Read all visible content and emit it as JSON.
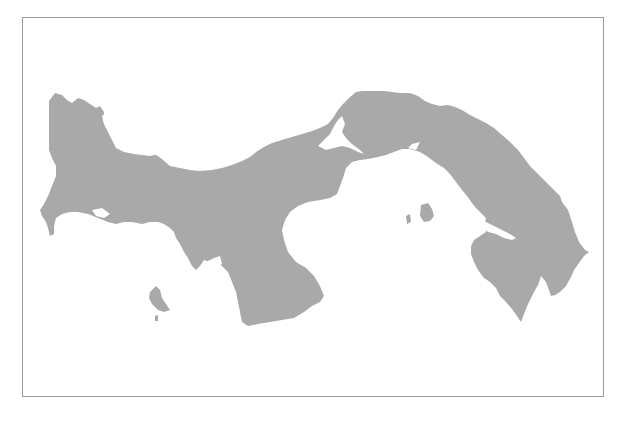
{
  "map": {
    "country": "Panama",
    "land_color": "#a9a9a9",
    "water_color": "#ffffff",
    "frame_color": "#9a9a9a",
    "labels": []
  }
}
